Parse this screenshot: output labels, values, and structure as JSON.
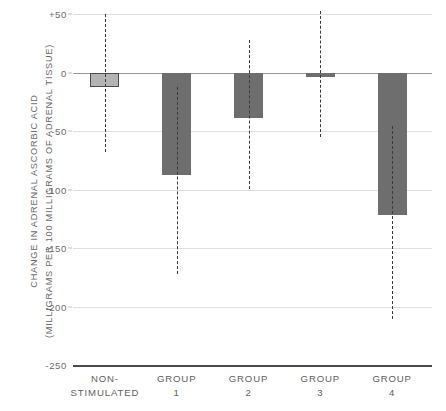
{
  "chart_data": {
    "type": "bar",
    "title": "",
    "subtitle": "",
    "xlabel": "",
    "ylabel": "CHANGE IN ADRENAL ASCORBIC ACID (MILLIGRAMS PER 100 MILLIGRAMS OF ADRENAL TISSUE)",
    "ylabel_lines": [
      "CHANGE IN  ADRENAL  ASCORBIC  ACID",
      "(MILLIGRAMS  PER  100  MILLIGRAMS  OF  ADRENAL  TISSUE)"
    ],
    "categories": [
      "NON-STIMULATED",
      "GROUP 1",
      "GROUP 2",
      "GROUP 3",
      "GROUP 4"
    ],
    "category_lines": [
      [
        "NON-",
        "STIMULATED"
      ],
      [
        "GROUP",
        "1"
      ],
      [
        "GROUP",
        "2"
      ],
      [
        "GROUP",
        "3"
      ],
      [
        "GROUP",
        "4"
      ]
    ],
    "values": [
      -12,
      -88,
      -39,
      -4,
      -122
    ],
    "error_low": [
      -68,
      -172,
      -100,
      -55,
      -211
    ],
    "error_high": [
      50,
      -12,
      28,
      53,
      -46
    ],
    "ylim": [
      -250,
      50
    ],
    "yticks": [
      50,
      0,
      -50,
      -100,
      -150,
      -200,
      -250
    ],
    "ytick_labels": [
      "+50",
      "0",
      "-50",
      "-100",
      "-150",
      "-200",
      "-250"
    ],
    "grid": true,
    "grid_axis": "y",
    "legend": "none",
    "bar_colors": [
      "#b4b4b4",
      "#6e6e6e",
      "#6e6e6e",
      "#6e6e6e",
      "#6e6e6e"
    ],
    "bar_outlined": [
      true,
      false,
      false,
      false,
      false
    ],
    "errorbar_style": "dashed-vertical-line",
    "errorbar_color": "#3a3a3a",
    "gridline_color": "#dfdfdf",
    "zero_line_color": "#9a9a9a",
    "baseline_color": "#4a4a4a",
    "text_color": "#606060"
  }
}
